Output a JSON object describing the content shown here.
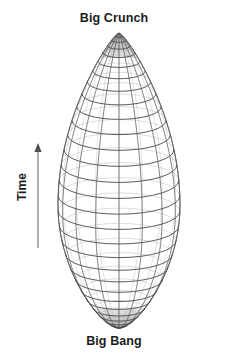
{
  "figure": {
    "title_top": "Big Crunch",
    "title_bottom": "Big Bang",
    "axis_label": "Time",
    "axis_icon": "up-arrow-icon",
    "diagram_name": "closed-universe-spindle-diagram",
    "colors": {
      "background": "#ffffff",
      "text": "#201d1d",
      "mesh_line": "#4a4a4a",
      "mesh_line_light": "#8f8f8f",
      "apex_fill": "#b9b9b9",
      "axis_arrow": "#6b6b6b"
    },
    "geometry": {
      "top_apex_y": 33,
      "bottom_apex_y": 328,
      "center_x": 119,
      "max_half_width": 61,
      "widest_y": 205,
      "latitude_count": 30,
      "meridian_count": 16
    },
    "axis": {
      "arrow_x": 38,
      "arrow_top_y": 145,
      "arrow_bottom_y": 248
    }
  }
}
